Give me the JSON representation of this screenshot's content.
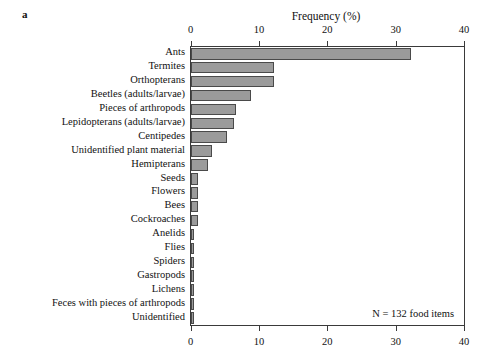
{
  "panel": {
    "letter": "a"
  },
  "annotation": {
    "n_text": "N = 132 food items"
  },
  "chart_data": {
    "type": "bar",
    "orientation": "horizontal",
    "title": "Frequency (%)",
    "xlabel": "Frequency (%)",
    "ylabel": "",
    "xlim": [
      0,
      40
    ],
    "xticks": [
      0,
      10,
      20,
      30,
      40
    ],
    "xtick_labels": [
      "0",
      "10",
      "20",
      "30",
      "40"
    ],
    "grid": false,
    "legend": null,
    "axis_top": true,
    "axis_bottom": true,
    "bar_fill_color": "#9b9b9b",
    "bar_edge_color": "#4a4a4a",
    "categories": [
      "Ants",
      "Termites",
      "Orthopterans",
      "Beetles (adults/larvae)",
      "Pieces of arthropods",
      "Lepidopterans (adults/larvae)",
      "Centipedes",
      "Unidentified plant material",
      "Hemipterans",
      "Seeds",
      "Flowers",
      "Bees",
      "Cockroaches",
      "Anelids",
      "Flies",
      "Spiders",
      "Gastropods",
      "Lichens",
      "Feces with pieces of arthropods",
      "Unidentified"
    ],
    "values": [
      32.2,
      12.2,
      12.2,
      8.9,
      6.7,
      6.3,
      5.4,
      3.2,
      2.5,
      1.1,
      1.1,
      1.1,
      1.1,
      0.4,
      0.4,
      0.4,
      0.4,
      0.4,
      0.4,
      0.4
    ],
    "annotation": "N = 132 food items"
  }
}
